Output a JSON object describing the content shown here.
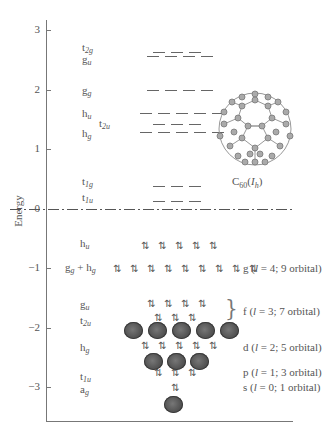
{
  "diagram": {
    "y_axis": {
      "label": "Energy",
      "ticks": [
        {
          "value": "3",
          "y": 30
        },
        {
          "value": "2",
          "y": 90
        },
        {
          "value": "1",
          "y": 149
        },
        {
          "value": "0",
          "y": 209
        },
        {
          "value": "−1",
          "y": 268
        },
        {
          "value": "−2",
          "y": 328
        },
        {
          "value": "−3",
          "y": 387
        }
      ]
    },
    "molecule_label": {
      "main": "C",
      "sub": "60",
      "symmetry": "I",
      "symmetry_sub": "h"
    },
    "unoccupied_levels": [
      {
        "name": "t",
        "sub": "2g",
        "dashes": 3,
        "energy": 2.6
      },
      {
        "name": "g",
        "sub": "u",
        "dashes": 4,
        "energy": 2.55
      },
      {
        "name": "g",
        "sub": "g",
        "dashes": 4,
        "energy": 2.0
      },
      {
        "name": "h",
        "sub": "u",
        "dashes": 5,
        "energy": 1.6
      },
      {
        "name": "t",
        "sub": "2u",
        "dashes": 3,
        "energy": 1.45
      },
      {
        "name": "h",
        "sub": "g",
        "dashes": 5,
        "energy": 1.3
      },
      {
        "name": "t",
        "sub": "1g",
        "dashes": 3,
        "energy": 0.4
      },
      {
        "name": "t",
        "sub": "1u",
        "dashes": 3,
        "energy": 0.15
      }
    ],
    "occupied_levels": [
      {
        "name": "h",
        "sub": "u",
        "pairs": 5,
        "energy": -0.7
      },
      {
        "name": "g",
        "sub": "g",
        "name2": "h",
        "sub2": "g",
        "pairs": 9,
        "energy": -1.0
      },
      {
        "name": "g",
        "sub": "u",
        "pairs": 4,
        "energy": -1.65
      },
      {
        "name": "t",
        "sub": "2u",
        "pairs": 3,
        "energy": -1.85
      },
      {
        "name": "h",
        "sub": "g",
        "pairs": 5,
        "energy": -2.3
      },
      {
        "name": "t",
        "sub": "1u",
        "pairs": 3,
        "energy": -2.75
      },
      {
        "name": "a",
        "sub": "g",
        "pairs": 1,
        "energy": -3.0
      }
    ],
    "orbital_shells": [
      {
        "letter": "g",
        "l": "4",
        "count": "9 orbital",
        "text": "g (l = 4; 9 orbital)"
      },
      {
        "letter": "f",
        "l": "3",
        "count": "7 orbital",
        "text": "f (l = 3; 7 orbital)",
        "orbitals_drawn": 5
      },
      {
        "letter": "d",
        "l": "2",
        "count": "5 orbital",
        "text": "d (l = 2; 5 orbital)",
        "orbitals_drawn": 3
      },
      {
        "letter": "p",
        "l": "1",
        "count": "3 orbital",
        "text": "p (l = 1; 3 orbital)"
      },
      {
        "letter": "s",
        "l": "0",
        "count": "1 orbital",
        "text": "s (l = 0; 1 orbital)",
        "orbitals_drawn": 1
      }
    ],
    "plus_sign": "+",
    "pair_glyph": "⇅",
    "colors": {
      "axis": "#777777",
      "text": "#555555",
      "orbital_fill": "#555555"
    }
  }
}
